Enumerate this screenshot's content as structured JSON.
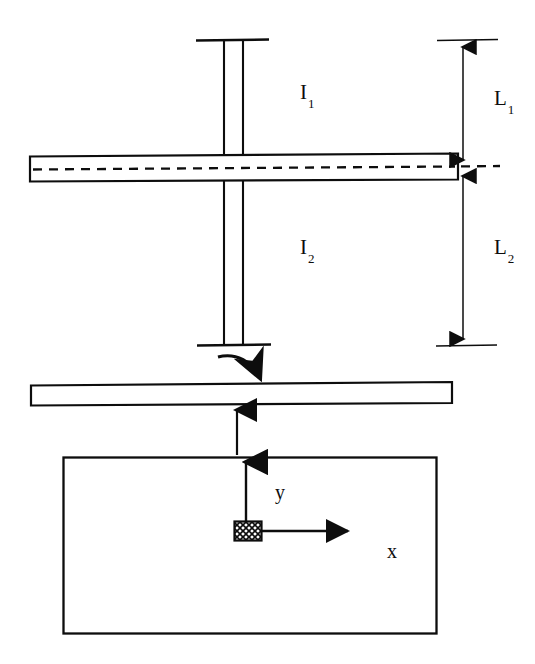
{
  "figure": {
    "type": "engineering-diagram",
    "background_color": "#ffffff",
    "line_color": "#0d0d0d",
    "labels": {
      "upper_column": {
        "base": "I",
        "sub": "1"
      },
      "lower_column": {
        "base": "I",
        "sub": "2"
      },
      "upper_length": {
        "base": "L",
        "sub": "1"
      },
      "lower_length": {
        "base": "L",
        "sub": "2"
      },
      "axis_x": "x",
      "axis_y": "y"
    },
    "elements": {
      "upper_column_label": "I1",
      "lower_column_label": "I2",
      "upper_dimension_label": "L1",
      "lower_dimension_label": "L2",
      "horizontal_axis_label": "x",
      "vertical_axis_label": "y"
    },
    "geometry": {
      "column_web_left_x": 224,
      "column_web_right_x": 243,
      "column_top_cap_y": 40,
      "column_bottom_cap_y": 345,
      "beam_left_x": 30,
      "beam_right_x": 458,
      "beam_top_y": 155,
      "beam_bottom_y": 181,
      "beam_centerline_y": 168,
      "dimension_line_x": 463,
      "plate_top_y": 383,
      "plate_bottom_y": 404,
      "section_rect": {
        "x": 63,
        "y": 457,
        "width": 374,
        "height": 177
      },
      "origin_square": {
        "x": 234,
        "y": 521,
        "width": 28,
        "height": 20
      }
    }
  }
}
